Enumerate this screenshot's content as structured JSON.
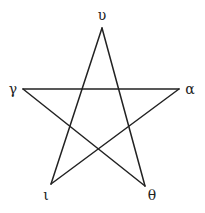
{
  "diagram": {
    "type": "pentagram",
    "stroke_color": "#222222",
    "background": "#ffffff",
    "vertices": [
      {
        "id": "upsilon",
        "label": "υ",
        "x": 102,
        "y": 28,
        "lx": 102,
        "ly": 20
      },
      {
        "id": "alpha",
        "label": "α",
        "x": 179,
        "y": 89,
        "lx": 190,
        "ly": 94
      },
      {
        "id": "theta",
        "label": "θ",
        "x": 145,
        "y": 186,
        "lx": 152,
        "ly": 200
      },
      {
        "id": "iota",
        "label": "ι",
        "x": 51,
        "y": 184,
        "lx": 46,
        "ly": 200
      },
      {
        "id": "gamma",
        "label": "γ",
        "x": 23,
        "y": 89,
        "lx": 13,
        "ly": 94
      }
    ],
    "edges": [
      {
        "from": "upsilon",
        "to": "iota"
      },
      {
        "from": "upsilon",
        "to": "theta"
      },
      {
        "from": "gamma",
        "to": "alpha"
      },
      {
        "from": "gamma",
        "to": "theta"
      },
      {
        "from": "alpha",
        "to": "iota"
      }
    ]
  }
}
